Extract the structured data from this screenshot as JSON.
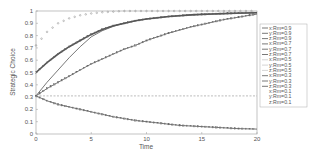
{
  "chart_data": {
    "type": "line",
    "title": "",
    "xlabel": "Time",
    "ylabel": "Strategic Choice",
    "xlim": [
      0,
      20
    ],
    "ylim": [
      0,
      1
    ],
    "xticks": [
      "0",
      "5",
      "10",
      "15",
      "20"
    ],
    "yticks": [
      "0",
      "0.1",
      "0.2",
      "0.3",
      "0.4",
      "0.5",
      "0.6",
      "0.7",
      "0.8",
      "0.9",
      "1"
    ],
    "grid": false,
    "legend_position": "right-outside",
    "legend": [
      "x:Rm=0.9",
      "y:Rm=0.9",
      "z:Rm=0.9",
      "x:Rm=0.7",
      "y:Rm=0.7",
      "z:Rm=0.7",
      "x:Rm=0.5",
      "y:Rm=0.5",
      "z:Rm=0.5",
      "x:Rm=0.3",
      "y:Rm=0.3",
      "z:Rm=0.3",
      "x:Rm=0.1",
      "y:Rm=0.1",
      "z:Rm=0.1"
    ],
    "x": [
      0,
      1,
      2,
      3,
      4,
      5,
      6,
      7,
      8,
      9,
      10,
      11,
      12,
      13,
      14,
      15,
      16,
      17,
      18,
      19,
      20
    ],
    "series": [
      {
        "name": "upper-dotted",
        "style": "dotted-circles",
        "values": [
          0.72,
          0.83,
          0.9,
          0.94,
          0.965,
          0.98,
          0.99,
          0.995,
          1,
          1,
          1,
          1,
          1,
          1,
          1,
          1,
          1,
          1,
          1,
          1,
          1
        ]
      },
      {
        "name": "star-markers",
        "style": "markers",
        "values": [
          0.5,
          0.58,
          0.65,
          0.71,
          0.76,
          0.81,
          0.85,
          0.88,
          0.9,
          0.92,
          0.935,
          0.945,
          0.955,
          0.962,
          0.968,
          0.972,
          0.976,
          0.979,
          0.982,
          0.984,
          0.986
        ]
      },
      {
        "name": "fast-rise-line",
        "style": "solid",
        "values": [
          0.31,
          0.42,
          0.52,
          0.62,
          0.71,
          0.79,
          0.84,
          0.875,
          0.9,
          0.92,
          0.935,
          0.945,
          0.955,
          0.962,
          0.968,
          0.972,
          0.976,
          0.979,
          0.982,
          0.984,
          0.986
        ]
      },
      {
        "name": "slow-rise-line",
        "style": "solid-markers",
        "values": [
          0.31,
          0.37,
          0.42,
          0.47,
          0.52,
          0.57,
          0.61,
          0.65,
          0.69,
          0.72,
          0.76,
          0.79,
          0.82,
          0.845,
          0.87,
          0.89,
          0.91,
          0.93,
          0.945,
          0.96,
          0.975
        ]
      },
      {
        "name": "flat-line",
        "style": "dashed",
        "values": [
          0.31,
          0.31,
          0.31,
          0.31,
          0.31,
          0.31,
          0.31,
          0.31,
          0.31,
          0.31,
          0.31,
          0.31,
          0.31,
          0.31,
          0.31,
          0.31,
          0.31,
          0.31,
          0.31,
          0.31,
          0.31
        ]
      },
      {
        "name": "decay-line",
        "style": "solid-markers",
        "values": [
          0.31,
          0.27,
          0.24,
          0.22,
          0.2,
          0.18,
          0.16,
          0.14,
          0.125,
          0.11,
          0.1,
          0.09,
          0.08,
          0.07,
          0.065,
          0.06,
          0.055,
          0.05,
          0.045,
          0.042,
          0.04
        ]
      }
    ]
  },
  "colors": {
    "axis": "#888888",
    "line": "#444444",
    "light": "#999999"
  }
}
